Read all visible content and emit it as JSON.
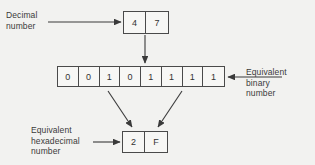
{
  "diagram": {
    "colors": {
      "background": "#f2f2f0",
      "stroke": "#4a4a4a",
      "text": "#3a3a3a",
      "box_fill": "#f7f7f5"
    },
    "labels": {
      "decimal": "Decimal\nnumber",
      "binary": "Equivalent\nbinary\nnumber",
      "hexadecimal": "Equivalent\nhexadecimal\nnumber"
    },
    "decimal_value": {
      "digits": [
        "4",
        "7"
      ],
      "value": "47"
    },
    "binary_value": {
      "digits": [
        "0",
        "0",
        "1",
        "0",
        "1",
        "1",
        "1",
        "1"
      ],
      "value": "00101111"
    },
    "hexadecimal_value": {
      "digits": [
        "2",
        "F"
      ],
      "value": "2F"
    }
  }
}
